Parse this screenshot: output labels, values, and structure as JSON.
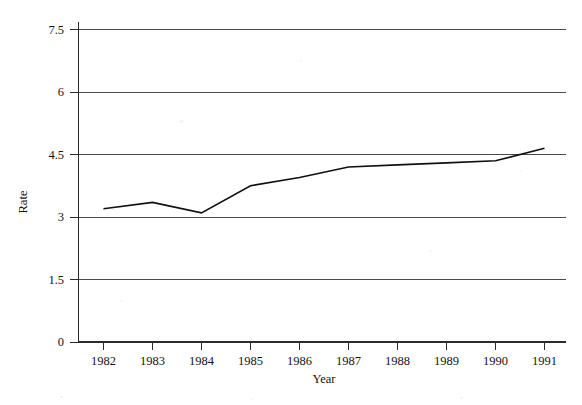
{
  "chart_data": {
    "type": "line",
    "title": "",
    "xlabel": "Year",
    "ylabel": "Rate",
    "x": [
      1982,
      1983,
      1984,
      1985,
      1986,
      1987,
      1988,
      1989,
      1990,
      1991
    ],
    "categories": [
      "1982",
      "1983",
      "1984",
      "1985",
      "1986",
      "1987",
      "1988",
      "1989",
      "1990",
      "1991"
    ],
    "values": [
      3.2,
      3.35,
      3.1,
      3.75,
      3.95,
      4.2,
      4.25,
      4.3,
      4.35,
      4.65
    ],
    "series": [
      {
        "name": "Rate",
        "values": [
          3.2,
          3.35,
          3.1,
          3.75,
          3.95,
          4.2,
          4.25,
          4.3,
          4.35,
          4.65
        ]
      }
    ],
    "yticks": [
      "0",
      "1.5",
      "3",
      "4.5",
      "6",
      "7.5"
    ],
    "ytick_values": [
      0,
      1.5,
      3,
      4.5,
      6,
      7.5
    ],
    "ylim": [
      0,
      7.5
    ],
    "xlim": [
      1982,
      1991
    ],
    "grid": "horizontal",
    "legend": "none",
    "line_color": "#101010",
    "grid_color": "#4a4a4a",
    "axis_color": "#2b2b2b",
    "background_color": "#ffffff"
  }
}
